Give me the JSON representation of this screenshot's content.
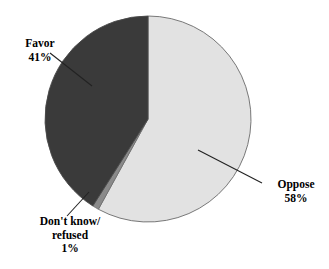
{
  "chart_data": {
    "type": "pie",
    "title": "",
    "subtitle": "",
    "xlabel": "",
    "ylabel": "",
    "legend_position": "none",
    "grid": false,
    "start_angle_deg": 0,
    "direction": "clockwise",
    "categories": [
      "Oppose",
      "Don't know/ refused",
      "Favor"
    ],
    "values": [
      58,
      1,
      41
    ],
    "unit": "%",
    "slices": [
      {
        "name": "oppose",
        "label": "Oppose",
        "value": 58,
        "value_label": "58%",
        "color": "#e2e2e2",
        "start_deg": 0,
        "end_deg": 208.8
      },
      {
        "name": "dont-know-refused",
        "label": "Don't know/ refused",
        "value": 1,
        "value_label": "1%",
        "color": "#8a8a8a",
        "start_deg": 208.8,
        "end_deg": 212.4
      },
      {
        "name": "favor",
        "label": "Favor",
        "value": 41,
        "value_label": "41%",
        "color": "#3a3a3a",
        "start_deg": 212.4,
        "end_deg": 360
      }
    ],
    "colors": {
      "favor": "#3a3a3a",
      "oppose": "#e2e2e2",
      "dont_know_refused": "#8a8a8a",
      "outline": "#555555",
      "leader_line": "#222222",
      "text": "#000000",
      "background": "#ffffff"
    }
  },
  "labels": {
    "favor": {
      "line1": "Favor",
      "line2": "41%"
    },
    "oppose": {
      "line1": "Oppose",
      "line2": "58%"
    },
    "dont_know": {
      "line1": "Don't know/",
      "line2": "refused",
      "line3": "1%"
    }
  }
}
